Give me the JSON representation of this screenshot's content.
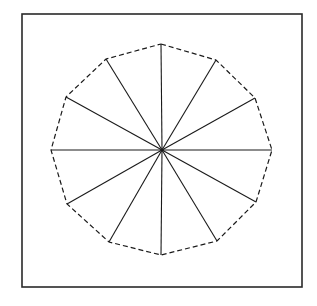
{
  "diagram": {
    "type": "regular-polygon-radial-division",
    "shape": "dodecagon",
    "sides": 12,
    "frame": {
      "x": 22,
      "y": 14,
      "width": 280,
      "height": 273,
      "stroke": "#2a2a2a",
      "stroke_width": 1.6
    },
    "center": {
      "x": 162,
      "y": 150
    },
    "vertices": [
      {
        "x": 161,
        "y": 44
      },
      {
        "x": 216,
        "y": 60
      },
      {
        "x": 255,
        "y": 98
      },
      {
        "x": 272,
        "y": 150
      },
      {
        "x": 256,
        "y": 202
      },
      {
        "x": 217,
        "y": 241
      },
      {
        "x": 161,
        "y": 255
      },
      {
        "x": 109,
        "y": 242
      },
      {
        "x": 67,
        "y": 204
      },
      {
        "x": 51,
        "y": 150
      },
      {
        "x": 66,
        "y": 97
      },
      {
        "x": 106,
        "y": 59
      }
    ],
    "outline": {
      "style": "dashed",
      "dash": "5 3",
      "stroke": "#1a1a1a",
      "stroke_width": 1.2
    },
    "spokes": {
      "count": 12,
      "stroke": "#1a1a1a",
      "stroke_width": 1.1
    },
    "background": "#ffffff"
  }
}
